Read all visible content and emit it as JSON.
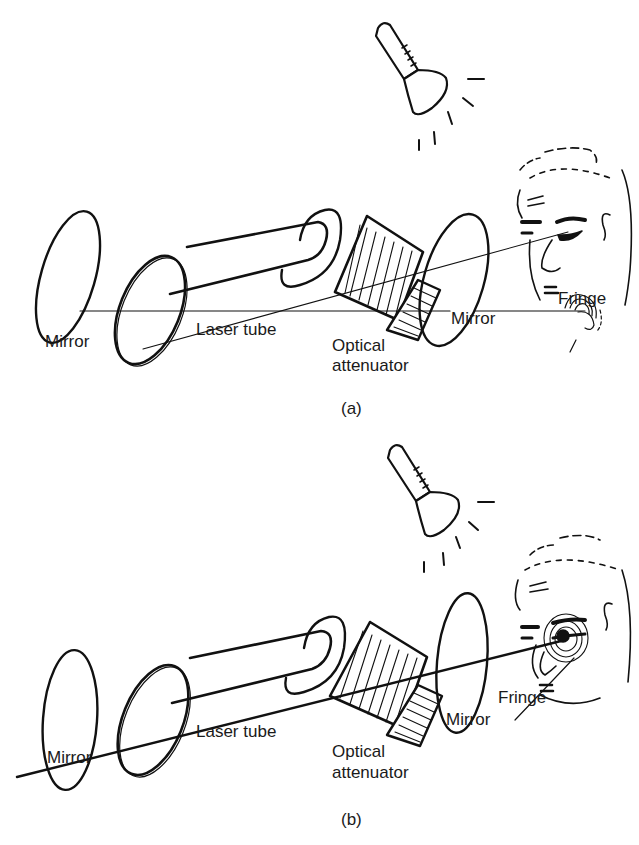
{
  "figure": {
    "panels": [
      {
        "id": "a",
        "caption": "(a)",
        "labels": {
          "mirror_left": "Mirror",
          "laser_tube": "Laser tube",
          "optical_line1": "Optical",
          "optical_line2": "attenuator",
          "mirror_right": "Mirror",
          "fringe": "Fringe"
        },
        "fringe_location": "chin"
      },
      {
        "id": "b",
        "caption": "(b)",
        "labels": {
          "mirror_left": "Mirror",
          "laser_tube": "Laser tube",
          "optical_line1": "Optical",
          "optical_line2": "attenuator",
          "mirror_right": "Mirror",
          "fringe": "Fringe"
        },
        "fringe_location": "eye"
      }
    ],
    "colors": {
      "ink": "#111111",
      "background": "#ffffff"
    },
    "icons": [
      "flashlight-icon",
      "face-icon",
      "mirror-icon",
      "laser-tube-icon",
      "attenuator-icon"
    ]
  }
}
